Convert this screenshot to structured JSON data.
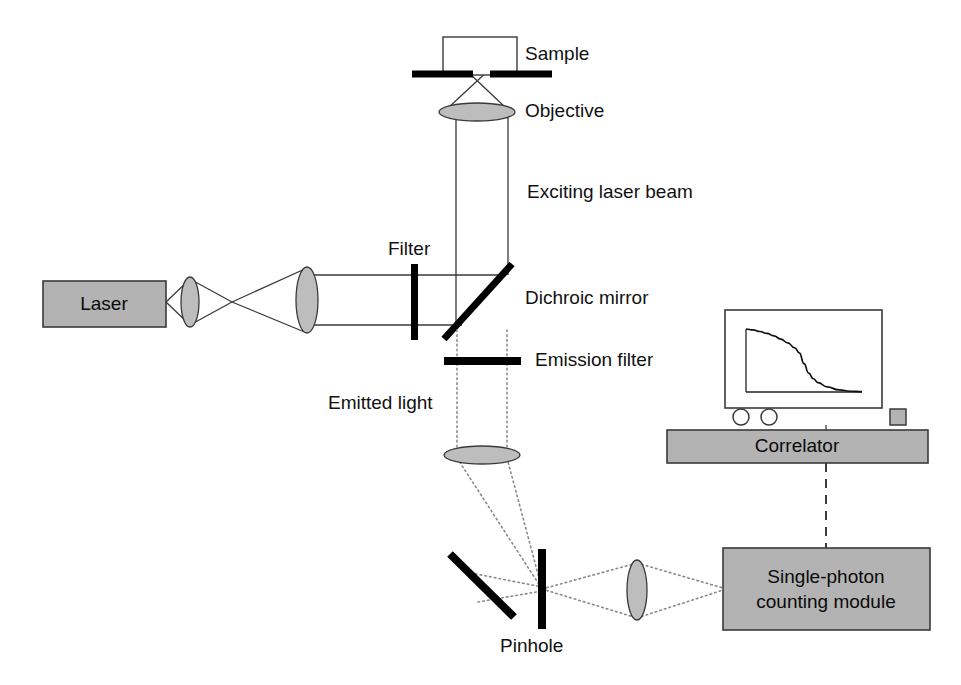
{
  "figure": {
    "kind": "optical-setup-diagram",
    "background_color": "#ffffff",
    "line_color": "#3a3a3a",
    "solid_black": "#000000",
    "box_fill": "#b3b3b3",
    "lens_fill": "#bdbdbd",
    "text_color": "#111111"
  },
  "boxes": {
    "laser": {
      "label": "Laser",
      "x": 43,
      "y": 281,
      "w": 123,
      "h": 46
    },
    "correlator": {
      "label": "Correlator",
      "x": 667,
      "y": 430,
      "w": 261,
      "h": 33
    },
    "detector": {
      "label_line1": "Single-photon",
      "label_line2": "counting module",
      "x": 723,
      "y": 548,
      "w": 207,
      "h": 82
    }
  },
  "labels": {
    "sample": "Sample",
    "objective": "Objective",
    "exciting_beam": "Exciting laser beam",
    "filter": "Filter",
    "dichroic_mirror": "Dichroic mirror",
    "emission_filter": "Emission filter",
    "emitted_light": "Emitted light",
    "pinhole": "Pinhole"
  },
  "components": {
    "sample_chamber": {
      "x": 443,
      "y": 37,
      "w": 74,
      "h": 38
    },
    "coverslip_left": {
      "x1": 412,
      "y1": 74,
      "x2": 473,
      "y2": 74
    },
    "coverslip_right": {
      "x1": 490,
      "y1": 74,
      "x2": 552,
      "y2": 74
    },
    "objective_lens": {
      "cx": 477,
      "cy": 112,
      "rx": 38,
      "ry": 9
    },
    "lens_1": {
      "cx": 190,
      "cy": 302,
      "rx": 9,
      "ry": 25
    },
    "lens_2": {
      "cx": 307,
      "cy": 300,
      "rx": 11,
      "ry": 33
    },
    "excitation_filter_bar": {
      "x": 411,
      "y": 264,
      "w": 7,
      "h": 76
    },
    "dichroic_mirror_bar": {
      "x1": 444,
      "y1": 339,
      "x2": 512,
      "y2": 264
    },
    "emission_filter_bar": {
      "x": 444,
      "y": 357,
      "w": 77,
      "h": 8
    },
    "tube_lens": {
      "cx": 482,
      "cy": 455,
      "rx": 38,
      "ry": 9
    },
    "fold_mirror_bar": {
      "x1": 450,
      "y1": 554,
      "x2": 514,
      "y2": 617
    },
    "pinhole_bar": {
      "x": 538,
      "y": 549,
      "w": 8,
      "h": 80
    },
    "collection_lens": {
      "cx": 637,
      "cy": 590,
      "rx": 10,
      "ry": 30
    }
  },
  "beams": {
    "excitation_rail_top_y": 275,
    "excitation_rail_bottom_y": 325,
    "vertical_rail_left_x": 456,
    "vertical_rail_right_x": 508,
    "emission_rail_left_x": 457,
    "emission_rail_right_x": 507,
    "focus_x": 232,
    "focus_y": 302
  },
  "monitor": {
    "screen": {
      "x": 725,
      "y": 310,
      "w": 157,
      "h": 98
    },
    "knob_1": {
      "cx": 741,
      "cy": 417,
      "r": 8
    },
    "knob_2": {
      "cx": 769,
      "cy": 417,
      "r": 8
    },
    "indicator": {
      "x": 890,
      "y": 409,
      "w": 16,
      "h": 16
    },
    "plot": {
      "axis_x": {
        "x1": 746,
        "y1": 392,
        "x2": 862,
        "y2": 392
      },
      "axis_y": {
        "x1": 746,
        "y1": 329,
        "x2": 746,
        "y2": 392
      }
    }
  },
  "chart_data": {
    "type": "line",
    "title": "",
    "xlabel": "",
    "ylabel": "",
    "x": [
      0,
      0.06,
      0.12,
      0.18,
      0.24,
      0.3,
      0.36,
      0.42,
      0.46,
      0.5,
      0.54,
      0.58,
      0.62,
      0.7,
      0.8,
      0.9,
      1.0
    ],
    "y": [
      1.0,
      0.985,
      0.96,
      0.93,
      0.89,
      0.84,
      0.78,
      0.7,
      0.62,
      0.45,
      0.3,
      0.21,
      0.15,
      0.08,
      0.035,
      0.012,
      0.005
    ],
    "xlim": [
      0,
      1
    ],
    "ylim": [
      0,
      1
    ],
    "grid": false,
    "legend": false
  },
  "connections": {
    "correlator_to_detector": {
      "style": "dashed",
      "x1": 826,
      "y1": 463,
      "x2": 826,
      "y2": 548
    },
    "monitor_to_correlator": {
      "style": "solid",
      "x1": 826,
      "y1": 425,
      "x2": 826,
      "y2": 430
    }
  }
}
